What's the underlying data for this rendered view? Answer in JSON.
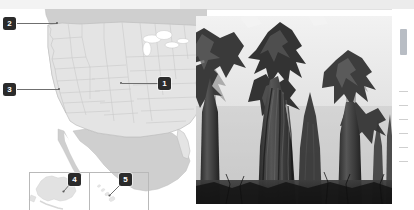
{
  "figure": {
    "kind": "us-map-with-photo"
  },
  "map": {
    "background_color": "#ffffff",
    "ocean_color": "#ffffff",
    "us_fill": "#e4e4e4",
    "neighbor_fill": "#cfcfcf",
    "border_color": "#bdbdbd",
    "state_border_color": "#c9c9c9",
    "inset_border_color": "#b9b9b9",
    "markers": [
      {
        "id": "1",
        "label": "1",
        "region": "Colorado",
        "x": 160,
        "y": 77,
        "anchor_x": 121,
        "anchor_y": 82
      },
      {
        "id": "2",
        "label": "2",
        "region": "Washington coast",
        "x": 4,
        "y": 17,
        "anchor_x": 53,
        "anchor_y": 24
      },
      {
        "id": "3",
        "label": "3",
        "region": "California",
        "x": 4,
        "y": 83,
        "anchor_x": 57,
        "anchor_y": 89
      },
      {
        "id": "4",
        "label": "4",
        "region": "Alaska",
        "x": 71,
        "y": 174,
        "anchor_x": 66,
        "anchor_y": 189
      },
      {
        "id": "5",
        "label": "5",
        "region": "Hawaii",
        "x": 122,
        "y": 174,
        "anchor_x": 112,
        "anchor_y": 190
      }
    ],
    "insets": [
      {
        "name": "alaska",
        "label": "Alaska"
      },
      {
        "name": "hawaii",
        "label": "Hawaii"
      }
    ]
  },
  "photo": {
    "subject": "giant sequoia trees",
    "style": "black-and-white",
    "sky_color": "#e9e9e9",
    "foliage_dark": "#2e2e2e",
    "foliage_mid": "#5a5a5a",
    "trunk_color": "#3a3a3a"
  },
  "right_sliver": {
    "accent_color": "#b8bdc4",
    "text_lines": [
      "",
      "",
      "",
      "",
      "",
      ""
    ]
  },
  "top_strip": {
    "color": "#ececec"
  }
}
